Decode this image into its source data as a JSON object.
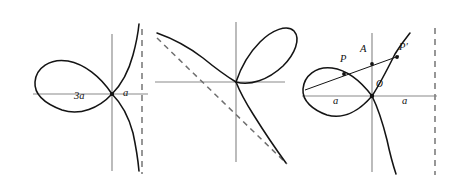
{
  "figure_set": {
    "title": "",
    "background_color": "#ffffff",
    "curve_color": "#141414",
    "axis_color": "#8a8a8a",
    "asymptote_color": "#7d7d7d",
    "panel_count": 3
  },
  "panels": [
    {
      "id": "left",
      "name": "folium-with-horizontal-loop",
      "labels": [
        {
          "name": "loop-width-label",
          "text": "3a",
          "x": 78,
          "y": 98
        },
        {
          "name": "distance-label-a",
          "text": "a",
          "x": 124,
          "y": 95
        }
      ],
      "features": {
        "has_vertical_axis": true,
        "has_horizontal_axis": true,
        "has_vertical_asymptote": true,
        "loop_orientation": "left",
        "branch_orientation": "right"
      }
    },
    {
      "id": "middle",
      "name": "folium-rotated-with-oblique-asymptote",
      "labels": [],
      "features": {
        "has_vertical_axis": true,
        "has_horizontal_axis": true,
        "has_oblique_asymptote": true,
        "loop_orientation": "upper-right",
        "branch_orientation": "diagonal"
      }
    },
    {
      "id": "right",
      "name": "folium-with-secant-construction",
      "labels": [
        {
          "name": "point-label-P",
          "text": "P",
          "x": 343,
          "y": 61
        },
        {
          "name": "point-label-A",
          "text": "A",
          "x": 363,
          "y": 51
        },
        {
          "name": "point-label-P-prime",
          "text": "P′",
          "x": 400,
          "y": 50
        },
        {
          "name": "origin-label-O",
          "text": "O",
          "x": 376,
          "y": 83
        },
        {
          "name": "distance-label-a-left",
          "text": "a",
          "x": 336,
          "y": 99
        },
        {
          "name": "distance-label-a-right",
          "text": "a",
          "x": 404,
          "y": 99
        }
      ],
      "features": {
        "has_vertical_axis": true,
        "has_horizontal_axis": true,
        "has_vertical_asymptote": true,
        "has_secant_line": true,
        "marked_points": [
          "P",
          "A",
          "P'",
          "O"
        ],
        "loop_orientation": "left",
        "branch_orientation": "right"
      }
    }
  ]
}
